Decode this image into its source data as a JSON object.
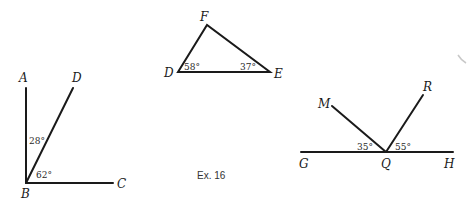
{
  "caption": "Ex. 16",
  "figures": {
    "right_angle": {
      "points": {
        "A": "A",
        "B": "B",
        "C": "C",
        "D": "D"
      },
      "angles": {
        "ABD": "28°",
        "DBC": "62°"
      }
    },
    "triangle": {
      "points": {
        "D": "D",
        "E": "E",
        "F": "F"
      },
      "angles": {
        "D": "58°",
        "E": "37°"
      }
    },
    "straight_line": {
      "points": {
        "G": "G",
        "H": "H",
        "M": "M",
        "Q": "Q",
        "R": "R"
      },
      "angles": {
        "GQM": "35°",
        "RQH": "55°"
      }
    }
  },
  "colors": {
    "ink": "#1a1a1a",
    "background": "#ffffff"
  }
}
